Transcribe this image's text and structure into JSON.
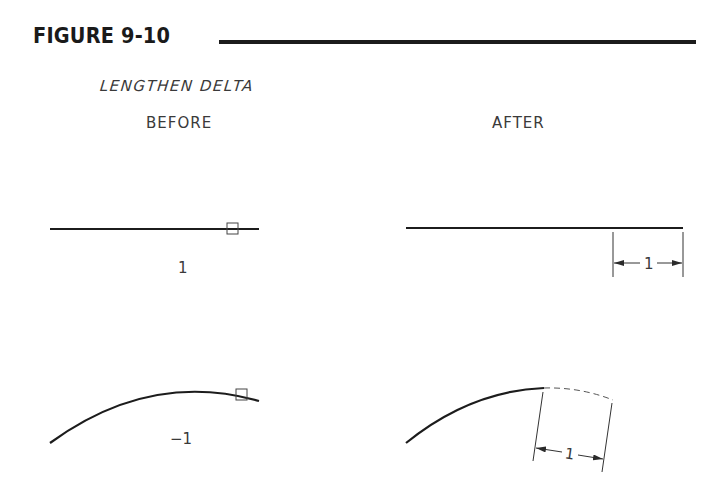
{
  "figure": {
    "title": "FIGURE 9-10",
    "subtitle": "LENGTHEN DELTA",
    "panels": {
      "before": {
        "label": "BEFORE"
      },
      "after": {
        "label": "AFTER"
      }
    }
  },
  "examples": [
    {
      "name": "line",
      "before": {
        "object": "line",
        "delta_value": "1",
        "pick_box": true
      },
      "after": {
        "object": "line",
        "dimension_label": "1"
      }
    },
    {
      "name": "arc",
      "before": {
        "object": "arc",
        "delta_value": "−1",
        "pick_box": true
      },
      "after": {
        "object": "arc",
        "removed_segment": "dashed",
        "dimension_label": "1"
      }
    }
  ],
  "colors": {
    "ink": "#1c1c1c",
    "text": "#3a3a3a",
    "background": "#ffffff"
  }
}
